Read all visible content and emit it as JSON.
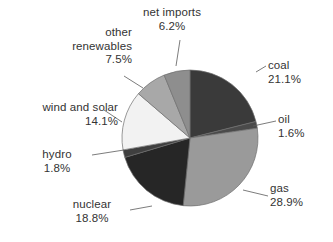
{
  "chart_data": {
    "type": "pie",
    "title": "",
    "subtitle": "",
    "xlabel": "",
    "ylabel": "",
    "legend_position": "none",
    "labels_style": "outside-callout-with-leader-lines",
    "grid": false,
    "categories": [
      "coal",
      "oil",
      "gas",
      "nuclear",
      "hydro",
      "wind and solar",
      "other renewables",
      "net imports"
    ],
    "values": [
      21.1,
      1.6,
      28.9,
      18.8,
      1.8,
      14.1,
      7.5,
      6.2
    ],
    "value_unit": "%",
    "slices": [
      {
        "label": "coal",
        "value": 21.1,
        "value_text": "21.1%",
        "color": "#3a3a3a"
      },
      {
        "label": "oil",
        "value": 1.6,
        "value_text": "1.6%",
        "color": "#4a4a4a"
      },
      {
        "label": "gas",
        "value": 28.9,
        "value_text": "28.9%",
        "color": "#9a9a9a"
      },
      {
        "label": "nuclear",
        "value": 18.8,
        "value_text": "18.8%",
        "color": "#262626"
      },
      {
        "label": "hydro",
        "value": 1.8,
        "value_text": "1.8%",
        "color": "#3f3f3f"
      },
      {
        "label": "wind and solar",
        "value": 14.1,
        "value_text": "14.1%",
        "color": "#f2f2f2"
      },
      {
        "label": "other renewables",
        "value": 7.5,
        "value_text": "7.5%",
        "color": "#a8a8a8"
      },
      {
        "label": "net imports",
        "value": 6.2,
        "value_text": "6.2%",
        "color": "#8e8e8e"
      }
    ],
    "total": 100.0,
    "start_angle_deg": 0,
    "direction": "clockwise",
    "colors": {
      "background": "#ffffff",
      "slice_outline": "#6f6f6f",
      "leader_line": "#5a5a5a",
      "text": "#333333"
    }
  },
  "callouts": {
    "coal": {
      "name": "coal",
      "pct": "21.1%"
    },
    "oil": {
      "name": "oil",
      "pct": "1.6%"
    },
    "gas": {
      "name": "gas",
      "pct": "28.9%"
    },
    "nuclear": {
      "name": "nuclear",
      "pct": "18.8%"
    },
    "hydro": {
      "name": "hydro",
      "pct": "1.8%"
    },
    "wind_and_solar": {
      "name": "wind and solar",
      "pct": "14.1%"
    },
    "other_renewables": {
      "name_line1": "other",
      "name_line2": "renewables",
      "pct": "7.5%"
    },
    "net_imports": {
      "name": "net imports",
      "pct": "6.2%"
    }
  }
}
